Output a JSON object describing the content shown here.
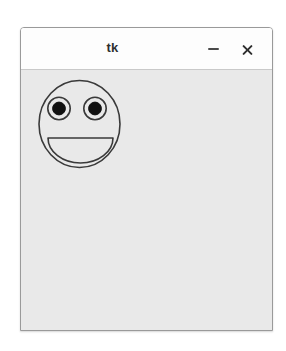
{
  "window": {
    "title": "tk",
    "titlebar_bg": "#fdfdfd",
    "canvas_bg": "#e9e9e9",
    "border_color": "#9a9a9a",
    "controls": [
      {
        "name": "minimize",
        "glyph": "–"
      },
      {
        "name": "close",
        "glyph": "×"
      }
    ]
  },
  "canvas": {
    "drawing_name": "smiley-face",
    "stroke_color": "#3a3a3a",
    "fill_color": "#000000",
    "shapes": {
      "face": {
        "type": "oval",
        "cx": 99,
        "cy": 149,
        "rx": 41,
        "ry": 44
      },
      "left_eye": {
        "type": "oval",
        "cx": 78.5,
        "cy": 133.5,
        "rx": 11.5,
        "ry": 11.5
      },
      "right_eye": {
        "type": "oval",
        "cx": 114.5,
        "cy": 133.5,
        "rx": 11.5,
        "ry": 11.5
      },
      "left_pupil": {
        "type": "oval",
        "cx": 78.5,
        "cy": 133.5,
        "rx": 6.5,
        "ry": 6.5
      },
      "right_pupil": {
        "type": "oval",
        "cx": 114.5,
        "cy": 133.5,
        "rx": 6.5,
        "ry": 6.5
      },
      "mouth": {
        "type": "arc",
        "style": "chord",
        "x1": 68,
        "y1": 163,
        "x2": 133,
        "y2": 163,
        "extent": 180
      }
    }
  }
}
